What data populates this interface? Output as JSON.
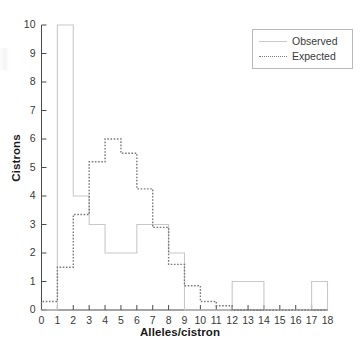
{
  "chart_data": {
    "type": "bar",
    "title": "",
    "subtitle": "",
    "xlabel": "Alleles/cistron",
    "ylabel": "Cistrons",
    "xlim": [
      0,
      18
    ],
    "ylim": [
      0,
      10
    ],
    "xticks": [
      0,
      1,
      2,
      3,
      4,
      5,
      6,
      7,
      8,
      9,
      10,
      11,
      12,
      13,
      14,
      15,
      16,
      17,
      18
    ],
    "yticks": [
      0,
      1,
      2,
      3,
      4,
      5,
      6,
      7,
      8,
      9,
      10
    ],
    "grid": false,
    "legend_position": "top-right",
    "bin_edges": [
      0,
      1,
      2,
      3,
      4,
      5,
      6,
      7,
      8,
      9,
      10,
      11,
      12,
      13,
      14,
      15,
      16,
      17,
      18
    ],
    "bin_labels": [
      "0-1",
      "1-2",
      "2-3",
      "3-4",
      "4-5",
      "5-6",
      "6-7",
      "7-8",
      "8-9",
      "9-10",
      "10-11",
      "11-12",
      "12-13",
      "13-14",
      "14-15",
      "15-16",
      "16-17",
      "17-18"
    ],
    "series": [
      {
        "name": "Observed",
        "style": "solid",
        "color": "#c8c8c8",
        "values": [
          0,
          10,
          4,
          3,
          2,
          2,
          3,
          3,
          2,
          0,
          0,
          0,
          1,
          1,
          0,
          0,
          0,
          1
        ]
      },
      {
        "name": "Expected",
        "style": "dotted",
        "color": "#7a7a7a",
        "values": [
          0.3,
          1.5,
          3.35,
          5.2,
          6.0,
          5.5,
          4.25,
          2.9,
          1.6,
          0.85,
          0.3,
          0.15,
          0,
          0,
          0,
          0,
          0,
          0
        ]
      }
    ]
  },
  "legend": {
    "entries": [
      {
        "label": "Observed",
        "swatch": "solid-line-swatch"
      },
      {
        "label": "Expected",
        "swatch": "dotted-line-swatch"
      }
    ]
  },
  "axes": {
    "x_title": "Alleles/cistron",
    "y_title": "Cistrons"
  },
  "colors": {
    "observed": "#c8c8c8",
    "expected": "#7a7a7a",
    "axis": "#4a4a4a",
    "text": "#231f20",
    "background": "#ffffff"
  }
}
